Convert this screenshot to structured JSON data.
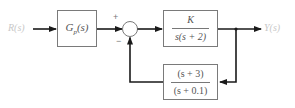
{
  "diagram": {
    "type": "feedback-control-block-diagram",
    "input_label": "R(s)",
    "output_label": "Y(s)",
    "prefilter_block": {
      "label_main": "G",
      "label_sub": "p",
      "label_arg": "(s)"
    },
    "summing_junction": {
      "plus_sign": "+",
      "minus_sign": "−"
    },
    "forward_block": {
      "numerator": "K",
      "denominator": "s(s + 2)"
    },
    "feedback_block": {
      "numerator": "(s + 3)",
      "denominator": "(s + 0.1)"
    },
    "colors": {
      "line": "#1a1a1a",
      "block_border": "#7a7a7a",
      "text": "#555555",
      "signal_label": "#c8c8c8"
    }
  }
}
